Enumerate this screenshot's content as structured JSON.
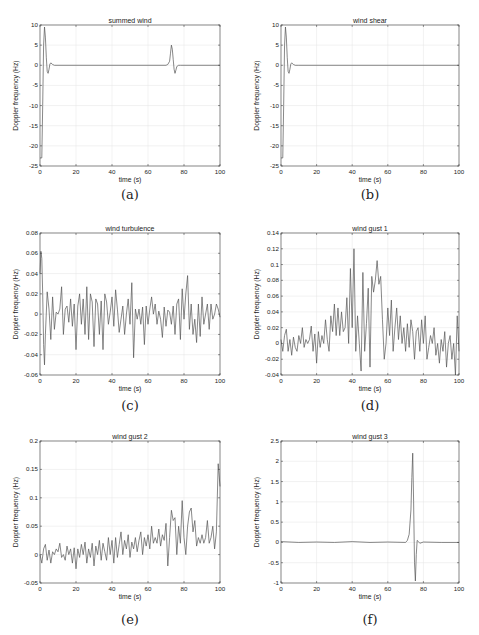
{
  "chart_data": [
    {
      "id": "a",
      "type": "line",
      "caption": "(a)",
      "title": "summed wind",
      "xlabel": "time (s)",
      "ylabel": "Doppler frequency (Hz)",
      "xlim": [
        0,
        100
      ],
      "ylim": [
        -25,
        10
      ],
      "xticks": [
        0,
        20,
        40,
        60,
        80,
        100
      ],
      "yticks": [
        10,
        5,
        0,
        -5,
        -10,
        -15,
        -20,
        -25
      ],
      "ytick_labels": [
        "10",
        "5",
        "0",
        "-5",
        "-10",
        "-15",
        "-20",
        "-25"
      ],
      "grid": true,
      "x": [
        0,
        1,
        1.5,
        2,
        2.5,
        3,
        3.5,
        4,
        4.5,
        5,
        5.5,
        6,
        7,
        8,
        10,
        20,
        40,
        60,
        70,
        71,
        72,
        72.5,
        73,
        73.5,
        74,
        74.5,
        75,
        75.5,
        76,
        77,
        78,
        80,
        100
      ],
      "values": [
        -23,
        -23,
        -10,
        5,
        9.5,
        7,
        2,
        -1.5,
        -2,
        -1,
        0.3,
        0.6,
        0.2,
        0,
        0,
        0,
        0,
        0,
        0,
        0.2,
        1,
        3,
        5,
        4,
        1.5,
        -1,
        -2,
        -1.2,
        -0.3,
        0,
        0,
        0,
        0
      ]
    },
    {
      "id": "b",
      "type": "line",
      "caption": "(b)",
      "title": "wind shear",
      "xlabel": "time (s)",
      "ylabel": "Doppler frequency (Hz)",
      "xlim": [
        0,
        100
      ],
      "ylim": [
        -25,
        10
      ],
      "xticks": [
        0,
        20,
        40,
        60,
        80,
        100
      ],
      "yticks": [
        10,
        5,
        0,
        -5,
        -10,
        -15,
        -20,
        -25
      ],
      "ytick_labels": [
        "10",
        "5",
        "0",
        "-5",
        "-10",
        "-15",
        "-20",
        "-25"
      ],
      "grid": true,
      "x": [
        0,
        1,
        1.5,
        2,
        2.5,
        3,
        3.5,
        4,
        4.5,
        5,
        5.5,
        6,
        7,
        8,
        10,
        100
      ],
      "values": [
        -23,
        -23,
        -10,
        5,
        9.5,
        7,
        2,
        -1.5,
        -2,
        -1,
        0.3,
        0.6,
        0.2,
        0,
        0,
        0
      ]
    },
    {
      "id": "c",
      "type": "line",
      "caption": "(c)",
      "title": "wind turbulence",
      "xlabel": "time (s)",
      "ylabel": "Doppler frequency (Hz)",
      "xlim": [
        0,
        100
      ],
      "ylim": [
        -0.06,
        0.08
      ],
      "xticks": [
        0,
        20,
        40,
        60,
        80,
        100
      ],
      "yticks": [
        0.08,
        0.06,
        0.04,
        0.02,
        0,
        -0.02,
        -0.04,
        -0.06
      ],
      "ytick_labels": [
        "0.08",
        "0.06",
        "0.04",
        "0.02",
        "0",
        "-0.02",
        "-0.04",
        "-0.06"
      ],
      "grid": true,
      "x": [
        0,
        0.5,
        1,
        1.5,
        2,
        2.5,
        3,
        4,
        5,
        6,
        7,
        8,
        9,
        10,
        11,
        12,
        13,
        14,
        15,
        16,
        17,
        18,
        19,
        20,
        21,
        22,
        23,
        24,
        25,
        26,
        27,
        28,
        29,
        30,
        31,
        32,
        33,
        34,
        35,
        36,
        37,
        38,
        39,
        40,
        41,
        42,
        43,
        44,
        45,
        46,
        47,
        48,
        49,
        50,
        51,
        52,
        53,
        54,
        55,
        56,
        57,
        58,
        59,
        60,
        61,
        62,
        63,
        64,
        65,
        66,
        67,
        68,
        69,
        70,
        71,
        72,
        73,
        74,
        75,
        76,
        77,
        78,
        79,
        80,
        81,
        82,
        83,
        84,
        85,
        86,
        87,
        88,
        89,
        90,
        91,
        92,
        93,
        94,
        95,
        96,
        97,
        98,
        99,
        100
      ],
      "values": [
        0.04,
        0.062,
        0.055,
        0.02,
        -0.03,
        -0.05,
        -0.02,
        0.022,
        0.005,
        -0.025,
        0.017,
        -0.015,
        0.002,
        0.0,
        0.005,
        0.027,
        -0.02,
        0.005,
        0.008,
        -0.008,
        0.015,
        -0.012,
        0.01,
        -0.035,
        0.008,
        0.02,
        -0.01,
        0.015,
        -0.02,
        0.027,
        -0.025,
        0.02,
        0.012,
        -0.032,
        0.015,
        0.01,
        -0.02,
        0.013,
        -0.035,
        0.02,
        0.012,
        -0.01,
        0.002,
        0.017,
        -0.012,
        0.024,
        0.005,
        -0.018,
        -0.005,
        0.008,
        -0.02,
        0.0,
        0.015,
        -0.01,
        0.031,
        -0.043,
        0.005,
        -0.005,
        0.005,
        -0.01,
        0.007,
        -0.03,
        0.008,
        -0.01,
        0.005,
        0.017,
        0.0,
        0.01,
        -0.01,
        0.003,
        -0.005,
        -0.023,
        0.007,
        -0.012,
        0.004,
        0.002,
        -0.01,
        0.008,
        -0.02,
        0.01,
        0.015,
        -0.025,
        0.025,
        -0.005,
        0.02,
        0.038,
        -0.015,
        0.01,
        -0.02,
        -0.005,
        -0.028,
        0.01,
        -0.022,
        0.017,
        -0.01,
        0.0,
        0.01,
        -0.015,
        0.01,
        -0.005,
        0.0,
        0.01,
        0.005,
        -0.003
      ],
      "values_note": "approximate trace"
    },
    {
      "id": "d",
      "type": "line",
      "caption": "(d)",
      "title": "wind gust 1",
      "xlabel": "time (s)",
      "ylabel": "Doppler frequency (Hz)",
      "xlim": [
        0,
        100
      ],
      "ylim": [
        -0.04,
        0.14
      ],
      "xticks": [
        0,
        20,
        40,
        60,
        80,
        100
      ],
      "yticks": [
        0.14,
        0.12,
        0.1,
        0.08,
        0.06,
        0.04,
        0.02,
        0,
        -0.02,
        -0.04
      ],
      "ytick_labels": [
        "0.14",
        "0.12",
        "0.1",
        "0.08",
        "0.06",
        "0.04",
        "0.02",
        "0",
        "-0.02",
        "-0.04"
      ],
      "grid": true,
      "x": [
        0,
        1,
        2,
        3,
        4,
        5,
        6,
        7,
        8,
        9,
        10,
        11,
        12,
        13,
        14,
        15,
        16,
        17,
        18,
        19,
        20,
        21,
        22,
        23,
        24,
        25,
        26,
        27,
        28,
        29,
        30,
        31,
        32,
        33,
        34,
        35,
        36,
        37,
        38,
        39,
        40,
        41,
        42,
        43,
        44,
        45,
        46,
        47,
        48,
        49,
        50,
        51,
        52,
        53,
        54,
        55,
        56,
        57,
        58,
        59,
        60,
        61,
        62,
        63,
        64,
        65,
        66,
        67,
        68,
        69,
        70,
        71,
        72,
        73,
        74,
        75,
        76,
        77,
        78,
        79,
        80,
        81,
        82,
        83,
        84,
        85,
        86,
        87,
        88,
        89,
        90,
        91,
        92,
        93,
        94,
        95,
        96,
        97,
        98,
        99,
        100
      ],
      "values": [
        0.005,
        -0.01,
        0.01,
        0.018,
        -0.01,
        0.005,
        -0.015,
        0.008,
        -0.005,
        -0.01,
        0.01,
        0.0,
        0.02,
        -0.005,
        0.005,
        0.0,
        0.005,
        0.022,
        -0.01,
        0.012,
        -0.025,
        0.015,
        -0.005,
        0.01,
        0.0,
        0.03,
        0.005,
        -0.01,
        0.035,
        0.015,
        0.05,
        0.01,
        0.045,
        0.01,
        0.04,
        0.015,
        0.02,
        0.058,
        0.0,
        0.095,
        0.02,
        0.12,
        -0.01,
        0.035,
        0.0,
        -0.035,
        0.09,
        -0.01,
        0.025,
        0.07,
        -0.03,
        0.085,
        0.065,
        0.08,
        0.105,
        0.075,
        0.085,
        0.03,
        -0.02,
        0.0,
        0.045,
        0.01,
        0.055,
        -0.01,
        0.02,
        0.045,
        0.005,
        0.035,
        0.0,
        0.02,
        -0.01,
        0.025,
        -0.005,
        0.03,
        0.015,
        -0.02,
        0.015,
        0.02,
        -0.01,
        0.03,
        0.0,
        0.035,
        -0.02,
        -0.005,
        0.01,
        0.0,
        0.02,
        -0.015,
        0.0,
        -0.025,
        0.005,
        -0.01,
        0.015,
        -0.03,
        0.0,
        0.01,
        -0.02,
        0.0,
        -0.04,
        0.035,
        -0.01
      ],
      "values_note": "approximate trace"
    },
    {
      "id": "e",
      "type": "line",
      "caption": "(e)",
      "title": "wind gust 2",
      "xlabel": "time (s)",
      "ylabel": "Doppler frequency (Hz)",
      "xlim": [
        0,
        100
      ],
      "ylim": [
        -0.05,
        0.2
      ],
      "xticks": [
        0,
        20,
        40,
        60,
        80,
        100
      ],
      "yticks": [
        0.2,
        0.15,
        0.1,
        0.05,
        0,
        -0.05
      ],
      "ytick_labels": [
        "0.2",
        "0.15",
        "0.1",
        "0.05",
        "0",
        "-0.05"
      ],
      "grid": true,
      "x": [
        0,
        1,
        2,
        3,
        4,
        5,
        6,
        7,
        8,
        9,
        10,
        11,
        12,
        13,
        14,
        15,
        16,
        17,
        18,
        19,
        20,
        21,
        22,
        23,
        24,
        25,
        26,
        27,
        28,
        29,
        30,
        31,
        32,
        33,
        34,
        35,
        36,
        37,
        38,
        39,
        40,
        41,
        42,
        43,
        44,
        45,
        46,
        47,
        48,
        49,
        50,
        51,
        52,
        53,
        54,
        55,
        56,
        57,
        58,
        59,
        60,
        61,
        62,
        63,
        64,
        65,
        66,
        67,
        68,
        69,
        70,
        71,
        72,
        73,
        74,
        75,
        76,
        77,
        78,
        79,
        80,
        81,
        82,
        83,
        84,
        85,
        86,
        87,
        88,
        89,
        90,
        91,
        92,
        93,
        94,
        95,
        96,
        97,
        98,
        99,
        100
      ],
      "values": [
        0.0,
        -0.015,
        0.01,
        0.018,
        -0.01,
        0.008,
        -0.015,
        0.005,
        0.0,
        0.01,
        0.005,
        0.02,
        -0.005,
        0.0,
        -0.01,
        0.015,
        0.0,
        0.01,
        -0.015,
        0.012,
        -0.025,
        0.01,
        -0.005,
        0.018,
        0.0,
        0.022,
        -0.015,
        0.01,
        -0.005,
        0.02,
        -0.02,
        0.015,
        0.0,
        0.025,
        -0.01,
        0.02,
        0.005,
        -0.01,
        0.03,
        0.0,
        0.025,
        -0.015,
        0.03,
        -0.005,
        0.018,
        0.04,
        0.0,
        0.025,
        0.01,
        0.035,
        -0.005,
        0.022,
        0.01,
        0.03,
        0.005,
        0.025,
        0.04,
        0.0,
        0.03,
        0.015,
        0.035,
        0.01,
        0.05,
        0.02,
        0.03,
        0.02,
        0.045,
        0.015,
        0.035,
        0.025,
        0.055,
        -0.02,
        0.03,
        0.078,
        0.06,
        0.065,
        0.0,
        0.05,
        0.02,
        0.095,
        0.03,
        0.0,
        0.05,
        0.075,
        0.082,
        0.04,
        0.06,
        0.015,
        0.03,
        0.02,
        0.035,
        0.02,
        0.03,
        0.06,
        0.02,
        0.03,
        0.05,
        0.01,
        0.04,
        0.16,
        0.12
      ],
      "values_note": "approximate trace"
    },
    {
      "id": "f",
      "type": "line",
      "caption": "(f)",
      "title": "wind gust 3",
      "xlabel": "time (s)",
      "ylabel": "Doppler frequency (Hz)",
      "xlim": [
        0,
        100
      ],
      "ylim": [
        -1,
        2.5
      ],
      "xticks": [
        0,
        20,
        40,
        60,
        80,
        100
      ],
      "yticks": [
        2.5,
        2,
        1.5,
        1,
        0.5,
        0,
        -0.5,
        -1
      ],
      "ytick_labels": [
        "2.5",
        "2",
        "1.5",
        "1",
        "0.5",
        "0",
        "-0.5",
        "-1"
      ],
      "grid": true,
      "x": [
        0,
        10,
        20,
        30,
        40,
        50,
        60,
        70,
        71,
        72,
        73,
        73.5,
        74,
        74.5,
        75,
        75.5,
        76,
        76.5,
        77,
        78,
        80,
        90,
        100
      ],
      "values": [
        0.02,
        0.0,
        0.01,
        0.0,
        0.02,
        0.0,
        0.01,
        0.0,
        0.05,
        0.2,
        0.8,
        1.6,
        2.2,
        1.0,
        -0.5,
        -0.95,
        -0.3,
        0.05,
        0.03,
        -0.02,
        0.01,
        0.0,
        0.0
      ]
    }
  ]
}
